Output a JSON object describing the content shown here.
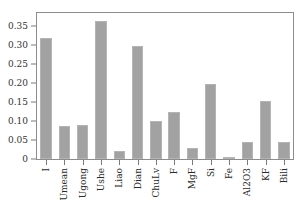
{
  "chart_data": {
    "type": "bar",
    "title": "",
    "subtitle": "",
    "xlabel": "",
    "ylabel": "",
    "categories": [
      "I",
      "Umean",
      "Ugong",
      "Ushe",
      "Liao",
      "Dian",
      "ChuLv",
      "F",
      "MgF",
      "Si",
      "Fe",
      "Al2O3",
      "KF",
      "Bili"
    ],
    "values": [
      0.32,
      0.086,
      0.089,
      0.365,
      0.02,
      0.297,
      0.099,
      0.124,
      0.03,
      0.198,
      0.004,
      0.046,
      0.152,
      0.046
    ],
    "series": [
      {
        "name": "importance",
        "values": [
          0.32,
          0.086,
          0.089,
          0.365,
          0.02,
          0.297,
          0.099,
          0.124,
          0.03,
          0.198,
          0.004,
          0.046,
          0.152,
          0.046
        ]
      }
    ],
    "ylim": [
      0,
      0.385
    ],
    "xlim": [
      0,
      14
    ],
    "y_ticks": [
      0,
      0.05,
      0.1,
      0.15,
      0.2,
      0.25,
      0.3,
      0.35
    ],
    "y_tick_labels": [
      "0",
      "0.05",
      "0.10",
      "0.15",
      "0.20",
      "0.25",
      "0.30",
      "0.35"
    ],
    "grid": false,
    "legend": false,
    "legend_position": "none",
    "bar_color": "#a2a2a2",
    "bar_edge_color": "#b4b4b4",
    "frame_color": "#8d8d8d",
    "axis_text_color": "#2b2b2b",
    "background_color": "#ffffff",
    "x_tick_label_rotation": 90,
    "annotations": []
  }
}
